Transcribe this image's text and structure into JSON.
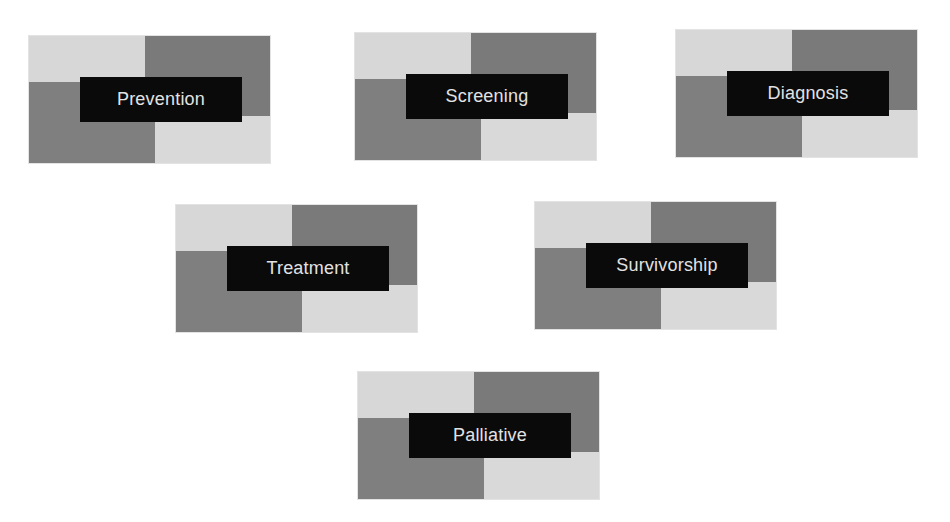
{
  "diagram": {
    "type": "card-grid",
    "colors": {
      "background": "#ffffff",
      "light_quadrant": "#d7d7d7",
      "dark_quadrant": "#7c7c7c",
      "label_background": "#0a0a0a",
      "label_text": "#e2e2e2"
    },
    "cards": [
      {
        "label": "Prevention"
      },
      {
        "label": "Screening"
      },
      {
        "label": "Diagnosis"
      },
      {
        "label": "Treatment"
      },
      {
        "label": "Survivorship"
      },
      {
        "label": "Palliative"
      }
    ]
  }
}
